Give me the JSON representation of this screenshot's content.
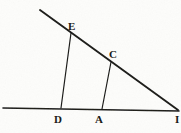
{
  "figure": {
    "kind": "geometry-diagram",
    "background_color": "#fdfdfb",
    "ink_color": "#1a1a18",
    "width": 181,
    "height": 133,
    "labels": [
      {
        "id": "E",
        "text": "E",
        "x": 68,
        "y": 21
      },
      {
        "id": "C",
        "text": "C",
        "x": 109,
        "y": 49
      },
      {
        "id": "D",
        "text": "D",
        "x": 54,
        "y": 114
      },
      {
        "id": "A",
        "text": "A",
        "x": 95,
        "y": 114
      },
      {
        "id": "B",
        "text": "I",
        "x": 175,
        "y": 114
      }
    ],
    "points": {
      "hypotenuse_start": {
        "x": 40,
        "y": 10
      },
      "E": {
        "x": 71,
        "y": 33
      },
      "C": {
        "x": 111,
        "y": 62
      },
      "apex": {
        "x": 178,
        "y": 110
      },
      "baseline_start": {
        "x": 3,
        "y": 108
      },
      "baseline_end": {
        "x": 179,
        "y": 111
      },
      "D": {
        "x": 61,
        "y": 108
      },
      "A": {
        "x": 102,
        "y": 109
      }
    },
    "segments": [
      {
        "name": "hypotenuse",
        "from": "hypotenuse_start",
        "to": "apex",
        "width": 1.9
      },
      {
        "name": "baseline",
        "from": "baseline_start",
        "to": "baseline_end",
        "width": 1.6
      },
      {
        "name": "segment-E-D",
        "from": "E",
        "to": "D",
        "width": 1.2
      },
      {
        "name": "segment-C-A",
        "from": "C",
        "to": "A",
        "width": 1.2
      }
    ]
  }
}
